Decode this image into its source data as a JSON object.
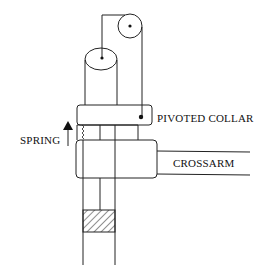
{
  "diagram": {
    "labels": {
      "pivoted_collar": "PIVOTED COLLAR",
      "spring": "SPRING",
      "crossarm": "CROSSARM"
    },
    "colors": {
      "line": "#222222",
      "background": "#ffffff"
    }
  }
}
